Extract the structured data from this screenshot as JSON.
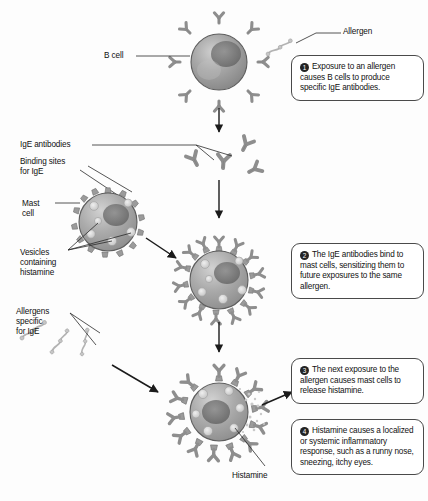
{
  "diagram": {
    "colors": {
      "background": "#fdfdfd",
      "cell_body": "#9a9a9a",
      "cell_outline": "#5d5d5d",
      "receptor": "#8c8c8c",
      "antibody": "#909090",
      "allergen": "#b5b5b5",
      "nucleus": "#6f6f6f",
      "vesicle": "#d8d8d8",
      "text": "#101010",
      "box_border": "#4a4a4a",
      "arrow": "#1b1b1b",
      "leader_line": "#2a2a2a",
      "histamine_granule": "#c9c9c9"
    }
  },
  "callouts": [
    {
      "number": "1",
      "text": "Exposure to an allergen causes B cells to produce specific IgE antibodies."
    },
    {
      "number": "2",
      "text": "The IgE antibodies bind to mast cells, sensitizing them to future exposures to the same allergen."
    },
    {
      "number": "3",
      "text": "The next exposure to the allergen causes mast cells to release histamine."
    },
    {
      "number": "4",
      "text": "Histamine causes a localized or systemic inflammatory response, such as a runny nose, sneezing, itchy eyes."
    }
  ],
  "labels": {
    "b_cell": "B cell",
    "allergen": "Allergen",
    "ige_antibodies": "IgE antibodies",
    "binding_sites": "Binding sites\nfor IgE",
    "mast_cell": "Mast\ncell",
    "vesicles": "Vesicles\ncontaining\nhistamine",
    "allergens_specific": "Allergens\nspecific\nfor IgE",
    "histamine": "Histamine"
  },
  "structures": {
    "b_cell": {
      "label": "B cell with surface IgE receptors",
      "receptor_count": 8
    },
    "free_antibodies": {
      "label": "Free IgE antibodies",
      "count": 4
    },
    "mast_cell_unsensitized": {
      "label": "Mast cell with empty IgE binding sites",
      "binding_site_count": 14,
      "vesicle_count": 6
    },
    "mast_cell_sensitized": {
      "label": "Sensitized mast cell with bound IgE antibodies",
      "antibody_count": 14,
      "vesicle_count": 6
    },
    "mast_cell_degranulating": {
      "label": "Mast cell releasing histamine",
      "antibody_count": 13,
      "vesicle_count": 6
    },
    "allergen_molecules": {
      "label": "Allergen molecules specific for IgE",
      "count": 3
    },
    "released_histamine": {
      "label": "Released histamine granules"
    }
  }
}
